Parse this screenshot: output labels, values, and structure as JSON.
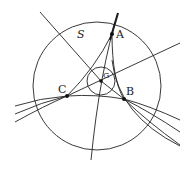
{
  "diagram": {
    "type": "geometric-construction",
    "colors": {
      "ink": "#222222",
      "background": "#ffffff"
    },
    "circle_label": "S",
    "points": [
      {
        "id": "A",
        "label": "A",
        "x": 112,
        "y": 34
      },
      {
        "id": "B",
        "label": "B",
        "x": 124,
        "y": 99
      },
      {
        "id": "C",
        "label": "C",
        "x": 67,
        "y": 96
      },
      {
        "id": "G",
        "label": "G",
        "x": 101,
        "y": 81
      }
    ],
    "circles": [
      {
        "name": "S",
        "cx": 97,
        "cy": 86,
        "r": 64
      },
      {
        "name": "inner",
        "cx": 101,
        "cy": 81,
        "r": 14
      }
    ]
  }
}
